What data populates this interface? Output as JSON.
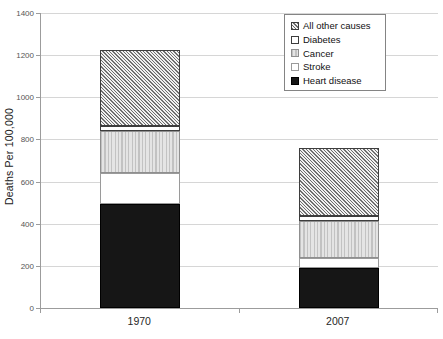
{
  "chart_data": {
    "type": "bar",
    "stacked": true,
    "title": "",
    "xlabel": "",
    "ylabel": "Deaths Per 100,000",
    "categories": [
      "1970",
      "2007"
    ],
    "series": [
      {
        "name": "Heart disease",
        "pattern": "solid-black",
        "values": [
          493,
          191
        ]
      },
      {
        "name": "Stroke",
        "pattern": "white-light-outline",
        "values": [
          148,
          45
        ]
      },
      {
        "name": "Cancer",
        "pattern": "vertical-stripes",
        "values": [
          199,
          178
        ]
      },
      {
        "name": "Diabetes",
        "pattern": "white-dark-outline",
        "values": [
          24,
          23
        ]
      },
      {
        "name": "All other causes",
        "pattern": "diagonal-hatch",
        "values": [
          359,
          324
        ]
      }
    ],
    "stack_totals": [
      1223,
      761
    ],
    "ylim": [
      0,
      1400
    ],
    "yticks": [
      0,
      200,
      400,
      600,
      800,
      1000,
      1200,
      1400
    ],
    "grid": true,
    "legend": {
      "position": "top-right",
      "entries": [
        "All other causes",
        "Diabetes",
        "Cancer",
        "Stroke",
        "Heart disease"
      ]
    }
  },
  "colors": {
    "background": "#ffffff",
    "gridline": "#d6d6d6",
    "axis": "#9c9c9c",
    "tick_label": "#555555",
    "category_label": "#262626",
    "legend_border": "#848484",
    "bar_black": "#161616"
  }
}
